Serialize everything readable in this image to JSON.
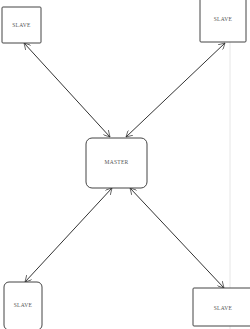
{
  "diagram": {
    "type": "star-topology",
    "colors": {
      "background": "#ffffff",
      "stroke": "#333333",
      "label": "#555555",
      "faint_line": "#e6e6e6"
    },
    "nodes": {
      "master": {
        "label": "MASTER"
      },
      "slave_top_left": {
        "label": "SLAVE"
      },
      "slave_top_right": {
        "label": "SLAVE"
      },
      "slave_bottom_left": {
        "label": "SLAVE"
      },
      "slave_bottom_right": {
        "label": "SLAVE"
      }
    },
    "edges": [
      {
        "from": "master",
        "to": "slave_top_left",
        "bidirectional": true
      },
      {
        "from": "master",
        "to": "slave_top_right",
        "bidirectional": true
      },
      {
        "from": "master",
        "to": "slave_bottom_left",
        "bidirectional": true
      },
      {
        "from": "master",
        "to": "slave_bottom_right",
        "bidirectional": true
      }
    ]
  }
}
